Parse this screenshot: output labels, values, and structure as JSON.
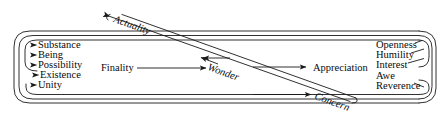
{
  "diagram": {
    "stroke_color": "#1a1a1a",
    "background_color": "#ffffff",
    "left_group": {
      "name": "transcendental-terms",
      "items": [
        {
          "label": "Substance",
          "marker": "arrowhead-right"
        },
        {
          "label": "Being",
          "marker": "arrowhead-right"
        },
        {
          "label": "Possibility",
          "marker": "arrowhead-right"
        },
        {
          "label": "Existence",
          "marker": "arrowhead-right"
        },
        {
          "label": "Unity",
          "marker": "arrowhead-right"
        }
      ]
    },
    "right_group": {
      "name": "responses",
      "items": [
        {
          "label": "Openness"
        },
        {
          "label": "Humility"
        },
        {
          "label": "Interest"
        },
        {
          "label": "Awe"
        },
        {
          "label": "Reverence"
        }
      ]
    },
    "middle_flow": {
      "source_label": "Finality",
      "center_label": "Wonder",
      "target_label": "Appreciation"
    },
    "diagonal_labels": {
      "upper": "Actuality",
      "lower": "Concern"
    }
  }
}
